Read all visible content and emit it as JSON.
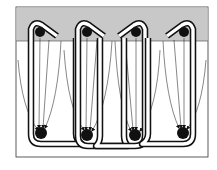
{
  "diagram": {
    "colors": {
      "background": "#ffffff",
      "upper_band": "#c8c8c8",
      "ink": "#111111"
    },
    "frame": {
      "x": 16,
      "y": 7,
      "width": 192,
      "height": 150
    },
    "upper_band": {
      "y_bottom": 41
    },
    "top_nodes": [
      {
        "id": "top-1",
        "cx": 40,
        "cy": 32,
        "r": 5
      },
      {
        "id": "top-2",
        "cx": 87,
        "cy": 32,
        "r": 5
      },
      {
        "id": "top-3",
        "cx": 136,
        "cy": 32,
        "r": 5
      },
      {
        "id": "top-4",
        "cx": 184,
        "cy": 32,
        "r": 5
      }
    ],
    "bottom_nodes": [
      {
        "id": "bottom-1",
        "cx": 41,
        "cy": 133,
        "r": 6
      },
      {
        "id": "bottom-2",
        "cx": 87,
        "cy": 135,
        "r": 6
      },
      {
        "id": "bottom-3",
        "cx": 135,
        "cy": 135,
        "r": 6
      },
      {
        "id": "bottom-4",
        "cx": 183,
        "cy": 133,
        "r": 6
      }
    ],
    "loops": [
      {
        "id": "loop-1",
        "orientation": "hook-right"
      },
      {
        "id": "loop-2",
        "orientation": "hook-right"
      },
      {
        "id": "loop-3",
        "orientation": "hook-left"
      },
      {
        "id": "loop-4",
        "orientation": "hook-left"
      }
    ],
    "arrow_bundles_per_node": 4,
    "labels": []
  }
}
